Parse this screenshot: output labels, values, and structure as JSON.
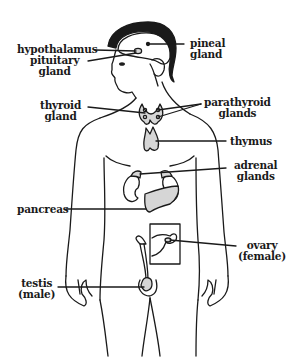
{
  "diagram": {
    "colors": {
      "ink": "#1a1a1a",
      "gland_fill": "#d6d6d6",
      "background": "#ffffff"
    },
    "labels": [
      {
        "id": "hypothalamus",
        "lines": [
          "hypothalamus"
        ]
      },
      {
        "id": "pituitary",
        "lines": [
          "pituitary",
          "gland"
        ]
      },
      {
        "id": "pineal",
        "lines": [
          "pineal",
          "gland"
        ]
      },
      {
        "id": "thyroid",
        "lines": [
          "thyroid",
          "gland"
        ]
      },
      {
        "id": "parathyroid",
        "lines": [
          "parathyroid",
          "glands"
        ]
      },
      {
        "id": "thymus",
        "lines": [
          "thymus"
        ]
      },
      {
        "id": "adrenal",
        "lines": [
          "adrenal",
          "glands"
        ]
      },
      {
        "id": "pancreas",
        "lines": [
          "pancreas"
        ]
      },
      {
        "id": "ovary",
        "lines": [
          "ovary",
          "(female)"
        ]
      },
      {
        "id": "testis",
        "lines": [
          "testis",
          "(male)"
        ]
      }
    ]
  }
}
